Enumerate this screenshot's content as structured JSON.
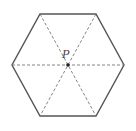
{
  "diagram": {
    "shape": "regular hexagon",
    "center_label": "P",
    "colors": {
      "outline": "#555555",
      "dashed": "#777777",
      "center_point": "#222222",
      "background": "#ffffff"
    },
    "vertices": [
      [
        40,
        14
      ],
      [
        96,
        14
      ],
      [
        124,
        65
      ],
      [
        96,
        116
      ],
      [
        40,
        116
      ],
      [
        12,
        65
      ]
    ],
    "center": [
      68,
      65
    ],
    "lines_from_center": "dashed segments to all six vertices"
  }
}
